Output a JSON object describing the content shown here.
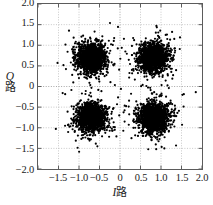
{
  "chart_data": {
    "type": "scatter",
    "title": "",
    "subtitle": "",
    "xlabel": "I路",
    "xlabel_symbol": "I",
    "xlabel_cjk": "路",
    "ylabel": "Q路",
    "ylabel_symbol": "Q",
    "ylabel_cjk": "路",
    "xlim": [
      -2.0,
      2.0
    ],
    "ylim": [
      -2.0,
      2.0
    ],
    "grid": true,
    "grid_interval": 0.5,
    "legend": null,
    "legend_position": "none",
    "point_color": "#000000",
    "point_size_px": 1.1,
    "frame_color": "#5b5b5b",
    "grid_color": "#b9b9b9",
    "background": "#ffffff",
    "xticks": [
      -2.0,
      -1.5,
      -1.0,
      -0.5,
      0,
      0.5,
      1.0,
      1.5,
      2.0
    ],
    "xticklabels": [
      "",
      "−1.5",
      "−1.0",
      "−0.5",
      "0",
      "0.5",
      "1.0",
      "1.5",
      "2.0"
    ],
    "yticks": [
      -2.0,
      -1.5,
      -1.0,
      -0.5,
      0,
      0.5,
      1.0,
      1.5,
      2.0
    ],
    "yticklabels": [
      "−2.0",
      "−1.5",
      "−1.0",
      "−0.5",
      "0",
      "0.5",
      "1.0",
      "1.5",
      "2.0"
    ],
    "clusters": [
      {
        "name": "symbol-01",
        "center_x": -0.7,
        "center_y": 0.7,
        "sigma_x": 0.17,
        "sigma_y": 0.17,
        "n_points": 1500
      },
      {
        "name": "symbol-11",
        "center_x": 0.82,
        "center_y": 0.7,
        "sigma_x": 0.17,
        "sigma_y": 0.17,
        "n_points": 1500
      },
      {
        "name": "symbol-00",
        "center_x": -0.7,
        "center_y": -0.75,
        "sigma_x": 0.17,
        "sigma_y": 0.17,
        "n_points": 1500
      },
      {
        "name": "symbol-10",
        "center_x": 0.82,
        "center_y": -0.75,
        "sigma_x": 0.17,
        "sigma_y": 0.17,
        "n_points": 1500
      }
    ]
  }
}
